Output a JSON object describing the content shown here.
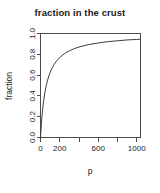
{
  "chart_data": {
    "type": "line",
    "title": "fraction in the crust",
    "xlabel": "p",
    "ylabel": "fraction",
    "xlim": [
      0,
      1040
    ],
    "ylim": [
      0.0,
      1.0
    ],
    "grid": false,
    "legend": null,
    "box": true,
    "xticks": [
      0,
      200,
      400,
      600,
      800,
      1000
    ],
    "xtick_labels": [
      "0",
      "200",
      "",
      "600",
      "",
      "1000"
    ],
    "yticks": [
      0.0,
      0.2,
      0.4,
      0.6,
      0.8,
      1.0
    ],
    "ytick_labels": [
      "0.0",
      "0.2",
      "0.4",
      "0.6",
      "0.8",
      "1.0"
    ],
    "series": [
      {
        "name": "fraction",
        "color": "#3a3a3a",
        "x": [
          0,
          5,
          10,
          15,
          20,
          25,
          30,
          40,
          50,
          60,
          70,
          80,
          90,
          100,
          120,
          140,
          160,
          180,
          200,
          225,
          250,
          275,
          300,
          350,
          400,
          450,
          500,
          600,
          700,
          800,
          900,
          1000,
          1040
        ],
        "y": [
          0.0,
          0.077,
          0.143,
          0.2,
          0.25,
          0.294,
          0.333,
          0.4,
          0.455,
          0.5,
          0.538,
          0.571,
          0.6,
          0.625,
          0.667,
          0.7,
          0.727,
          0.75,
          0.769,
          0.789,
          0.806,
          0.821,
          0.833,
          0.854,
          0.87,
          0.882,
          0.893,
          0.909,
          0.921,
          0.93,
          0.938,
          0.943,
          0.945
        ]
      }
    ]
  },
  "figure": {
    "background_color": "#ffffff",
    "axis_color": "#4d4d4d",
    "text_color": "#1a1a1a"
  }
}
